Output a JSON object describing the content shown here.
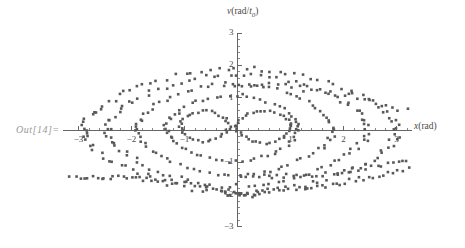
{
  "notebook": {
    "out_label": "Out[14]="
  },
  "chart_data": {
    "type": "scatter",
    "title": "",
    "xlabel": "x(rad)",
    "xlabel_parts": {
      "symbol": "x",
      "unit": "(rad)"
    },
    "ylabel": "v(rad/t0)",
    "ylabel_parts": {
      "symbol": "v",
      "open": "(rad/",
      "sub_symbol": "t",
      "sub": "0",
      "close": ")"
    },
    "xlim": [
      -3.3,
      3.3
    ],
    "ylim": [
      -3.0,
      3.0
    ],
    "xticks": [
      -3,
      -2,
      -1,
      1,
      2,
      3
    ],
    "xtick_labels": [
      "-3",
      "-2",
      "-1",
      "1",
      "2",
      "3"
    ],
    "yticks": [
      3,
      2,
      1,
      -1,
      -2,
      -3
    ],
    "ytick_labels": [
      "3",
      "2",
      "1",
      "-1",
      "-2",
      "-3"
    ],
    "minor_ticks_per_interval": 4,
    "grid": false,
    "legend": null,
    "marker": {
      "shape": "square",
      "size_px": 2.6,
      "color": "#595959"
    },
    "axes_color": "#555555",
    "series": [
      {
        "name": "libration-orbit-inner-1",
        "comment": "innermost closed orbit about x = -0.62",
        "closed": true,
        "n": 34,
        "center": [
          -0.62,
          0.12
        ],
        "rx": 0.46,
        "ry": 0.42,
        "jitter": 0.035
      },
      {
        "name": "libration-orbit-inner-2",
        "comment": "small closed orbit about x = 0.48",
        "closed": true,
        "n": 38,
        "center": [
          0.5,
          0.1
        ],
        "rx": 0.52,
        "ry": 0.45,
        "jitter": 0.035
      },
      {
        "name": "libration-orbit-2",
        "closed": true,
        "n": 62,
        "center": [
          -0.1,
          0.05
        ],
        "rx": 1.25,
        "ry": 0.92,
        "jitter": 0.05
      },
      {
        "name": "libration-orbit-3",
        "closed": true,
        "n": 78,
        "center": [
          -0.05,
          0.02
        ],
        "rx": 1.85,
        "ry": 1.25,
        "jitter": 0.06
      },
      {
        "name": "libration-orbit-4",
        "closed": true,
        "n": 96,
        "center": [
          0.0,
          0.0
        ],
        "rx": 2.45,
        "ry": 1.55,
        "jitter": 0.07
      },
      {
        "name": "separatrix-orbit-5",
        "closed": true,
        "n": 110,
        "center": [
          0.05,
          -0.02
        ],
        "rx": 2.95,
        "ry": 1.72,
        "jitter": 0.08
      },
      {
        "name": "rotation-band-upper",
        "comment": "running trajectory arcs upper right quadrant",
        "closed": false,
        "n": 26,
        "x_from": -0.2,
        "x_to": 3.2,
        "y_from": 1.45,
        "y_to": 0.62,
        "jitter": 0.09
      },
      {
        "name": "rotation-band-lower-left",
        "comment": "long running trajectory sweeping down-left",
        "closed": false,
        "n": 44,
        "x_from": -3.15,
        "x_to": 0.35,
        "y_from": -1.45,
        "y_to": -2.05,
        "jitter": 0.06
      },
      {
        "name": "rotation-band-lower-right",
        "closed": false,
        "n": 40,
        "x_from": -0.25,
        "x_to": 3.2,
        "y_from": -2.0,
        "y_to": -1.18,
        "jitter": 0.07
      },
      {
        "name": "rotation-band-lower-right-2",
        "closed": false,
        "n": 34,
        "x_from": 0.1,
        "x_to": 3.2,
        "y_from": -1.42,
        "y_to": -0.95,
        "jitter": 0.07
      }
    ]
  }
}
